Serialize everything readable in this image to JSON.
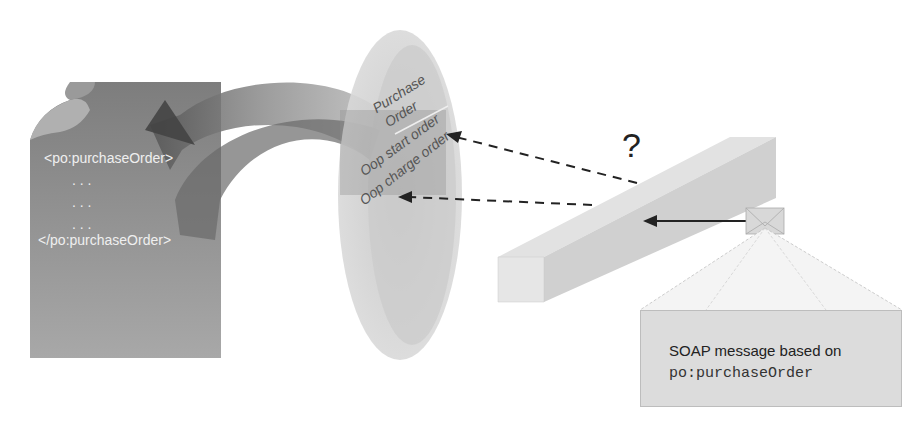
{
  "document": {
    "lines": [
      "<po:purchaseOrder>",
      ". . .",
      ". . .",
      ". . .",
      "</po:purchaseOrder>"
    ]
  },
  "disc": {
    "labels": [
      "Purchase",
      "Order",
      "Oop start order",
      "Oop charge order"
    ]
  },
  "channel": {
    "question_mark": "?"
  },
  "soap_message": {
    "line1": "SOAP message based on",
    "line2": "po:purchaseOrder"
  },
  "colors": {
    "document": "#8a8a8a",
    "arc": "#7a7a7a",
    "disc": "#cfcfcf",
    "channel": "#d4d4d4",
    "soap_box": "#dcdcdc",
    "arrow": "#222222"
  }
}
